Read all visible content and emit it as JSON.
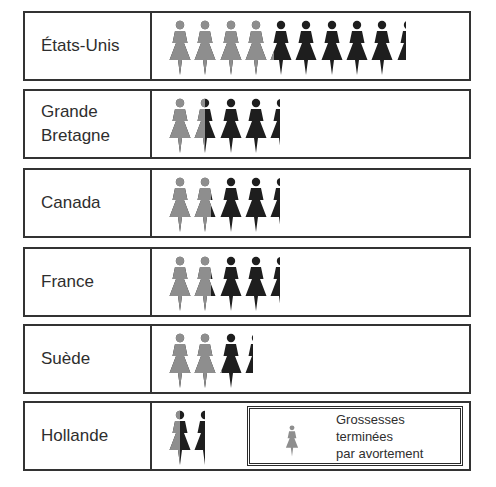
{
  "colors": {
    "aborted": "#8e8e8e",
    "other": "#1e1e1e",
    "border": "#333333"
  },
  "legend": {
    "icon": "woman-figure-icon",
    "icon_color": "#8e8e8e",
    "label": "Grossesses\nterminées\npar avortement"
  },
  "rows": [
    {
      "label": "États-Unis",
      "total": 9.45,
      "aborted": 4.2
    },
    {
      "label": "Grande\nBretagne",
      "total": 4.45,
      "aborted": 1.5
    },
    {
      "label": "Canada",
      "total": 4.45,
      "aborted": 1.75
    },
    {
      "label": "France",
      "total": 4.45,
      "aborted": 1.75
    },
    {
      "label": "Suède",
      "total": 3.4,
      "aborted": 2.15
    },
    {
      "label": "Hollande",
      "total": 1.5,
      "aborted": 0.5
    }
  ],
  "chart_data": {
    "type": "bar",
    "subtype": "pictogram",
    "title": "",
    "xlabel": "",
    "ylabel": "",
    "unit": "figures (woman pictograms)",
    "categories": [
      "États-Unis",
      "Grande Bretagne",
      "Canada",
      "France",
      "Suède",
      "Hollande"
    ],
    "series": [
      {
        "name": "Grossesses terminées par avortement",
        "color": "#8e8e8e",
        "values": [
          4.2,
          1.5,
          1.75,
          1.75,
          2.15,
          0.5
        ]
      },
      {
        "name": "Autres grossesses",
        "color": "#1e1e1e",
        "values": [
          5.25,
          2.95,
          2.7,
          2.7,
          1.25,
          1.0
        ]
      }
    ],
    "totals": [
      9.45,
      4.45,
      4.45,
      4.45,
      3.4,
      1.5
    ],
    "stacked": true,
    "orientation": "horizontal",
    "legend": {
      "position": "bottom-right inside last row",
      "entries": [
        "Grossesses terminées par avortement"
      ]
    },
    "grid": false
  }
}
